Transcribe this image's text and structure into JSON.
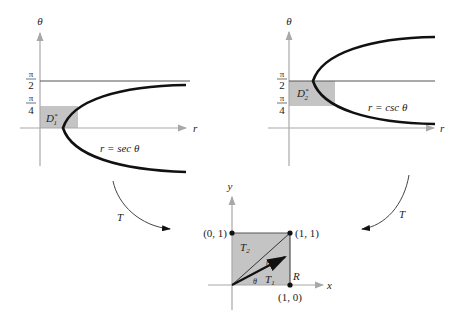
{
  "figure": {
    "left_plot": {
      "vertical_axis_label": "θ",
      "horizontal_axis_label": "r",
      "tick_pi_over_2": {
        "num": "π",
        "den": "2"
      },
      "tick_pi_over_4": {
        "num": "π",
        "den": "4"
      },
      "region_label": {
        "main": "D",
        "sub": "1",
        "sup": "*"
      },
      "curve_label": "r = sec θ"
    },
    "right_plot": {
      "vertical_axis_label": "θ",
      "horizontal_axis_label": "r",
      "tick_pi_over_2": {
        "num": "π",
        "den": "2"
      },
      "tick_pi_over_4": {
        "num": "π",
        "den": "4"
      },
      "region_label": {
        "main": "D",
        "sub": "2",
        "sup": "*"
      },
      "curve_label": "r = csc θ"
    },
    "bottom_plot": {
      "vertical_axis_label": "y",
      "horizontal_axis_label": "x",
      "points": [
        {
          "label": "(0, 1)"
        },
        {
          "label": "(1, 1)"
        },
        {
          "label": "(1, 0)"
        }
      ],
      "region_label": "R",
      "triangle_upper": {
        "main": "T",
        "sub": "2"
      },
      "triangle_lower": {
        "main": "T",
        "sub": "1"
      },
      "vector_label": "r",
      "angle_label": "θ"
    },
    "map_arrows": {
      "left": "T",
      "right": "T"
    },
    "colors": {
      "shade": "#c4c4c4",
      "axis": "#a8a8a8",
      "curve": "#111111",
      "line": "#555555"
    }
  }
}
